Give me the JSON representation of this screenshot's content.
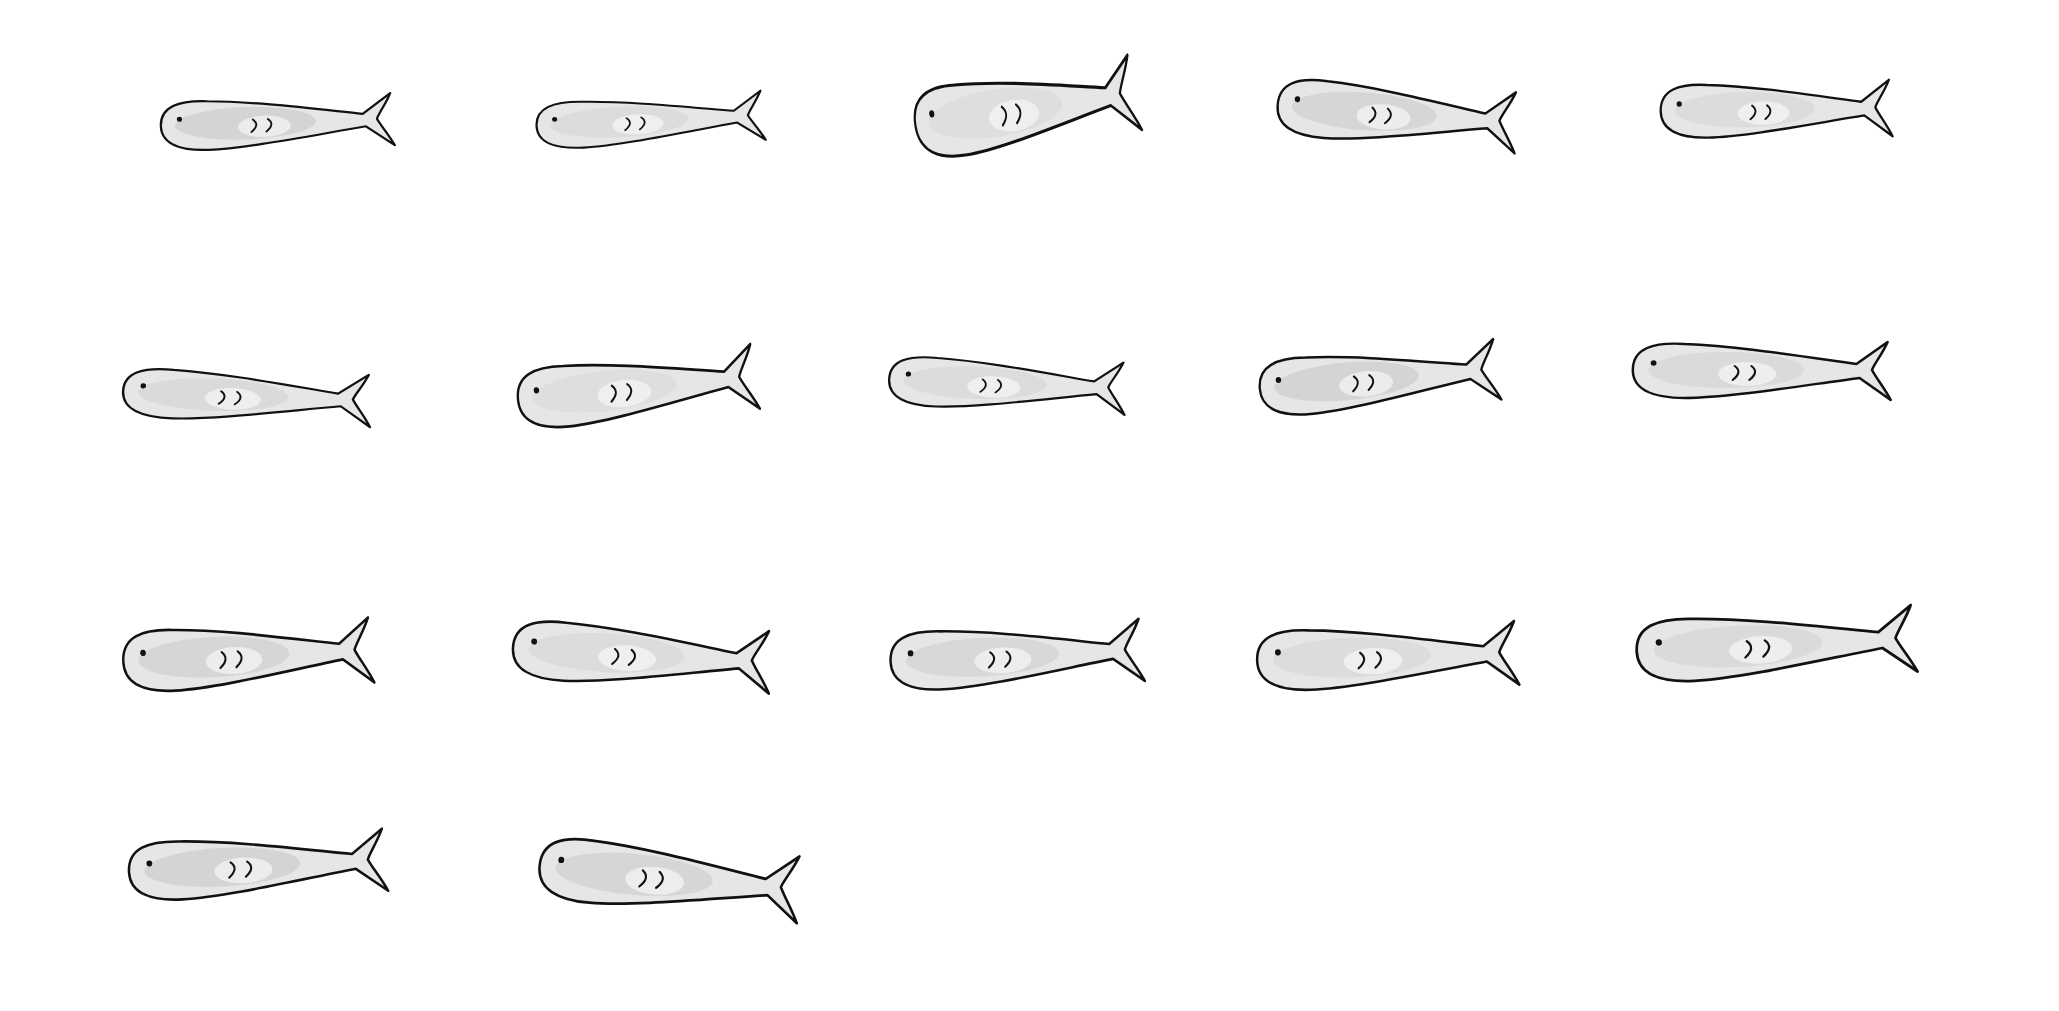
{
  "canvas": {
    "width": 2059,
    "height": 1011,
    "background": "#ffffff"
  },
  "style": {
    "outline": "#111111",
    "fill": "#e6e6e6",
    "shade": "#d2d2d2",
    "highlight": "#f6f6f6"
  },
  "fish": [
    {
      "x": 142,
      "y": 86,
      "w": 282,
      "h": 72,
      "rot": -2,
      "shade": 0.9
    },
    {
      "x": 518,
      "y": 86,
      "w": 276,
      "h": 68,
      "rot": -3,
      "shade": 0.5
    },
    {
      "x": 896,
      "y": 55,
      "w": 270,
      "h": 105,
      "rot": -9,
      "shade": 0.4
    },
    {
      "x": 1258,
      "y": 72,
      "w": 290,
      "h": 84,
      "rot": 4,
      "shade": 0.8
    },
    {
      "x": 1642,
      "y": 70,
      "w": 280,
      "h": 78,
      "rot": -1,
      "shade": 0.5
    },
    {
      "x": 103,
      "y": 360,
      "w": 300,
      "h": 72,
      "rot": 2,
      "shade": 0.6
    },
    {
      "x": 498,
      "y": 342,
      "w": 290,
      "h": 90,
      "rot": -6,
      "shade": 0.4
    },
    {
      "x": 870,
      "y": 348,
      "w": 286,
      "h": 72,
      "rot": 2,
      "shade": 0.5
    },
    {
      "x": 1240,
      "y": 336,
      "w": 290,
      "h": 84,
      "rot": -5,
      "shade": 0.9
    },
    {
      "x": 1612,
      "y": 330,
      "w": 312,
      "h": 80,
      "rot": 0,
      "shade": 0.6
    },
    {
      "x": 103,
      "y": 610,
      "w": 302,
      "h": 90,
      "rot": -3,
      "shade": 0.8
    },
    {
      "x": 492,
      "y": 612,
      "w": 312,
      "h": 86,
      "rot": 3,
      "shade": 0.5
    },
    {
      "x": 870,
      "y": 612,
      "w": 306,
      "h": 86,
      "rot": -3,
      "shade": 0.7
    },
    {
      "x": 1236,
      "y": 612,
      "w": 316,
      "h": 88,
      "rot": -2,
      "shade": 0.5
    },
    {
      "x": 1614,
      "y": 598,
      "w": 338,
      "h": 92,
      "rot": -3,
      "shade": 0.6
    },
    {
      "x": 108,
      "y": 822,
      "w": 312,
      "h": 86,
      "rot": -3,
      "shade": 0.9
    },
    {
      "x": 518,
      "y": 832,
      "w": 316,
      "h": 92,
      "rot": 5,
      "shade": 0.8
    }
  ]
}
